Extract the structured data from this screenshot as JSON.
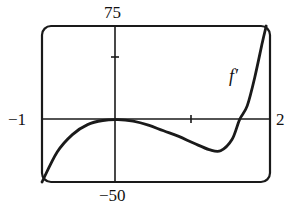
{
  "chart_data": {
    "type": "line",
    "title": "",
    "xlabel": "",
    "ylabel": "",
    "xlim": [
      -1,
      2
    ],
    "ylim": [
      -50,
      75
    ],
    "x_tick_labels": {
      "left": "-1",
      "right": "2"
    },
    "y_tick_labels": {
      "top": "75",
      "bottom": "-50"
    },
    "x_ticks": [
      1
    ],
    "y_ticks": [
      25
    ],
    "grid": false,
    "series": [
      {
        "name": "f'",
        "annotation": "f′",
        "x": [
          -1.0,
          -0.8,
          -0.6,
          -0.4,
          -0.2,
          0.0,
          0.2,
          0.4,
          0.6,
          0.8,
          1.0,
          1.2,
          1.35,
          1.5,
          1.6,
          1.7,
          1.8,
          1.9,
          1.95
        ],
        "values": [
          -50,
          -26,
          -12,
          -4,
          -0.7,
          0,
          -1.3,
          -4.5,
          -9,
          -13.5,
          -19,
          -24,
          -25,
          -16,
          0,
          11,
          34,
          62,
          75
        ]
      }
    ]
  },
  "labels": {
    "y_top": "75",
    "y_bottom": "−50",
    "x_left": "−1",
    "x_right": "2",
    "curve": "f′"
  }
}
